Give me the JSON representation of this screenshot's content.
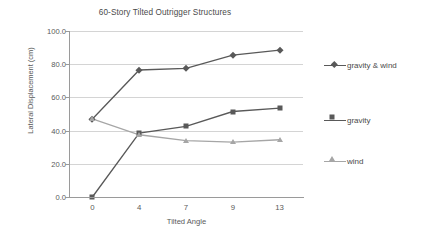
{
  "chart_data": {
    "type": "line",
    "title": "60-Story Tilted Outrigger Structures",
    "xlabel": "Tilted Angle",
    "ylabel": "Lateral Displacement (cm)",
    "categories": [
      "0",
      "4",
      "7",
      "9",
      "13"
    ],
    "ytick_labels": [
      "0.0",
      "20.0",
      "40.0",
      "60.0",
      "80.0",
      "100.0"
    ],
    "ytick_values": [
      0,
      20,
      40,
      60,
      80,
      100
    ],
    "ylim": [
      0,
      100
    ],
    "grid": "horizontal",
    "legend_position": "right",
    "series": [
      {
        "name": "gravity & wind",
        "marker": "diamond",
        "color": "#595959",
        "values": [
          47.0,
          76.5,
          77.5,
          85.5,
          88.5
        ]
      },
      {
        "name": "gravity",
        "marker": "square",
        "color": "#595959",
        "values": [
          0.0,
          38.5,
          42.5,
          51.5,
          53.5
        ]
      },
      {
        "name": "wind",
        "marker": "triangle",
        "color": "#a6a6a6",
        "values": [
          47.0,
          37.5,
          34.0,
          33.0,
          34.5
        ]
      }
    ]
  },
  "colors": {
    "axis": "#9a9a9a",
    "gridline": "#d4d4d4",
    "text": "#4a4a4a",
    "series_dark": "#595959",
    "series_light": "#a6a6a6",
    "background": "#ffffff"
  }
}
